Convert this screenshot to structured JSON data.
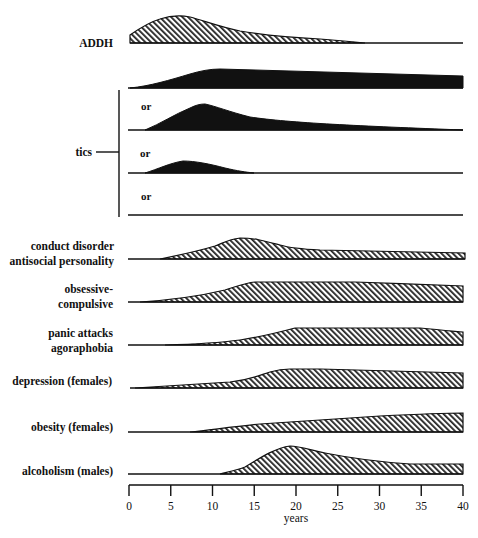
{
  "chart_data": {
    "type": "area",
    "title": "",
    "xlabel": "years",
    "ylabel": "",
    "xlim": [
      0,
      40
    ],
    "xticks": [
      0,
      5,
      10,
      15,
      20,
      25,
      30,
      35,
      40
    ],
    "grid": false,
    "legend": null,
    "note": "Relative prevalence profiles by age; heights are relative (0-1 scale, estimated from drawing).",
    "series": [
      {
        "name": "ADDH",
        "fill": "hatch-wide",
        "x": [
          0,
          2,
          4,
          6,
          8,
          10,
          14,
          18,
          22,
          26,
          28.3,
          40
        ],
        "values": [
          0.25,
          0.6,
          0.85,
          0.98,
          0.96,
          0.85,
          0.55,
          0.35,
          0.2,
          0.05,
          0,
          0
        ]
      },
      {
        "name": "tics (pattern 1)",
        "group": "tics",
        "fill": "solid",
        "x": [
          0,
          4,
          8,
          11,
          20,
          30,
          40
        ],
        "values": [
          0,
          0.4,
          0.85,
          1.0,
          0.95,
          0.85,
          0.7
        ]
      },
      {
        "name": "tics (pattern 2)",
        "group": "tics",
        "prefix": "or",
        "fill": "solid",
        "x": [
          0,
          2,
          5,
          8.8,
          12,
          16,
          24,
          32,
          40
        ],
        "values": [
          0,
          0,
          0.5,
          1.0,
          0.75,
          0.5,
          0.3,
          0.15,
          0
        ]
      },
      {
        "name": "tics (pattern 3)",
        "group": "tics",
        "prefix": "or",
        "fill": "solid",
        "x": [
          0,
          2,
          4,
          6.6,
          10,
          14.8,
          40
        ],
        "values": [
          0,
          0,
          0.25,
          0.48,
          0.3,
          0,
          0
        ]
      },
      {
        "name": "tics (pattern 4)",
        "group": "tics",
        "prefix": "or",
        "fill": "none",
        "x": [
          0,
          40
        ],
        "values": [
          0,
          0
        ]
      },
      {
        "name": "conduct disorder / antisocial personality",
        "fill": "hatch",
        "x": [
          0,
          4,
          8,
          10.5,
          13,
          15,
          19.8,
          30,
          40.2
        ],
        "values": [
          0,
          0.1,
          0.35,
          0.65,
          0.8,
          0.75,
          0.45,
          0.35,
          0.25
        ]
      },
      {
        "name": "obsessive-compulsive",
        "fill": "hatch",
        "x": [
          0,
          4,
          8,
          12,
          15,
          20,
          27,
          33,
          40
        ],
        "values": [
          0,
          0.05,
          0.25,
          0.6,
          0.8,
          0.8,
          0.8,
          0.75,
          0.65
        ]
      },
      {
        "name": "panic attacks / agoraphobia",
        "fill": "hatch",
        "x": [
          0,
          4,
          9,
          13,
          16,
          19.9,
          25,
          34.8,
          40
        ],
        "values": [
          0,
          0.02,
          0.08,
          0.25,
          0.45,
          0.68,
          0.68,
          0.68,
          0.52
        ]
      },
      {
        "name": "depression (females)",
        "fill": "hatch",
        "x": [
          0,
          0.7,
          6,
          11,
          15,
          18.7,
          22.9,
          30,
          40
        ],
        "values": [
          0,
          0.02,
          0.12,
          0.25,
          0.5,
          0.76,
          0.76,
          0.7,
          0.6
        ]
      },
      {
        "name": "obesity (females)",
        "fill": "hatch",
        "x": [
          0,
          7.3,
          10,
          15,
          20,
          25,
          30,
          35,
          40
        ],
        "values": [
          0,
          0,
          0.12,
          0.28,
          0.4,
          0.5,
          0.62,
          0.72,
          0.76
        ]
      },
      {
        "name": "alcoholism (males)",
        "fill": "hatch",
        "x": [
          0,
          10.9,
          12,
          14,
          16,
          19.2,
          22,
          27,
          32,
          40
        ],
        "values": [
          0,
          0,
          0.15,
          0.3,
          0.6,
          1.0,
          0.88,
          0.65,
          0.45,
          0.4
        ]
      }
    ]
  },
  "labels": {
    "addh": "ADDH",
    "tics": "tics",
    "or": "or",
    "conduct_1": "conduct disorder",
    "conduct_2": "antisocial personality",
    "ocd_1": "obsessive-",
    "ocd_2": "compulsive",
    "panic_1": "panic attacks",
    "panic_2": "agoraphobia",
    "depression": "depression (females)",
    "obesity": "obesity (females)",
    "alcoholism": "alcoholism (males)"
  },
  "axis": {
    "xlabel": "years",
    "ticks": [
      "0",
      "5",
      "10",
      "15",
      "20",
      "25",
      "30",
      "35",
      "40"
    ]
  }
}
